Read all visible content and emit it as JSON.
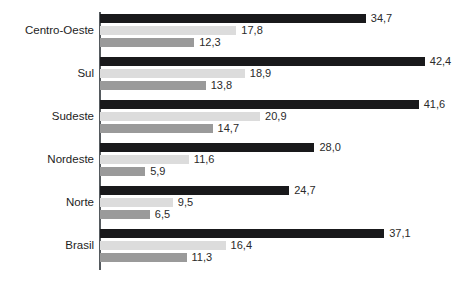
{
  "top_clipped_text": "                                        ",
  "chart_data": {
    "type": "bar",
    "orientation": "horizontal",
    "title": "",
    "subtitle": "",
    "xlabel": "",
    "ylabel": "",
    "categories": [
      "Centro-Oeste",
      "Sul",
      "Sudeste",
      "Nordeste",
      "Norte",
      "Brasil"
    ],
    "series": [
      {
        "name": "serie-1",
        "color": "#19191b",
        "values": [
          34.7,
          42.4,
          41.6,
          28.0,
          24.7,
          37.1
        ],
        "labels": [
          "34,7",
          "42,4",
          "41,6",
          "28,0",
          "24,7",
          "37,1"
        ]
      },
      {
        "name": "serie-2",
        "color": "#dcdcdc",
        "values": [
          17.8,
          18.9,
          20.9,
          11.6,
          9.5,
          16.4
        ],
        "labels": [
          "17,8",
          "18,9",
          "20,9",
          "11,6",
          "9,5",
          "16,4"
        ]
      },
      {
        "name": "serie-3",
        "color": "#9a9a9a",
        "values": [
          12.3,
          13.8,
          14.7,
          5.9,
          6.5,
          11.3
        ],
        "labels": [
          "12,3",
          "13,8",
          "14,7",
          "5,9",
          "6,5",
          "11,3"
        ]
      }
    ],
    "xlim": [
      0,
      47.4
    ],
    "grid": false,
    "legend": "none",
    "decimal_separator": ","
  },
  "layout": {
    "axis_x_px": 100,
    "axis_top_px": 12,
    "axis_bottom_px": 270,
    "px_per_unit": 7.66,
    "bar_height_px": 9,
    "bar_gap_px": 3,
    "group_pitch_px": 43,
    "first_group_top_px": 14,
    "value_label_offset_px": 5
  }
}
